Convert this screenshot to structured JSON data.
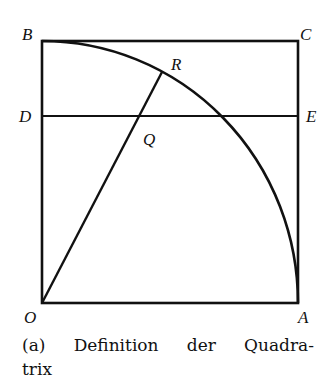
{
  "figure": {
    "points": {
      "B": {
        "label": "B",
        "x": 42,
        "y": 41
      },
      "C": {
        "label": "C",
        "x": 298,
        "y": 41
      },
      "D": {
        "label": "D",
        "x": 42,
        "y": 116
      },
      "E": {
        "label": "E",
        "x": 298,
        "y": 116
      },
      "O": {
        "label": "O",
        "x": 42,
        "y": 303
      },
      "A": {
        "label": "A",
        "x": 298,
        "y": 303
      },
      "R": {
        "label": "R",
        "x": 162,
        "y": 72
      },
      "Q": {
        "label": "Q",
        "x": 140,
        "y": 116
      }
    },
    "caption": {
      "words": [
        "(a)",
        "Definition",
        "der",
        "Quadra-"
      ],
      "line2": "trix"
    }
  }
}
